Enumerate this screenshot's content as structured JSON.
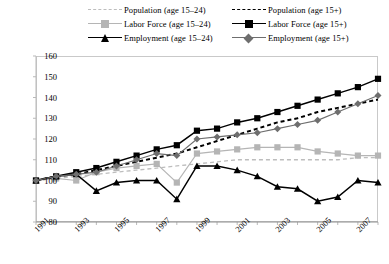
{
  "legend": {
    "items": [
      {
        "label": "Population (age 15–24)",
        "marker": "none",
        "line": "dashed",
        "color": "#bdbdbd",
        "col": 0,
        "row": 0
      },
      {
        "label": "Population (age 15+)",
        "marker": "none",
        "line": "dashed",
        "color": "#000000",
        "col": 1,
        "row": 0
      },
      {
        "label": "Labor Force (age 15–24)",
        "marker": "square",
        "line": "solid",
        "color": "#b5b5b5",
        "col": 0,
        "row": 1
      },
      {
        "label": "Labor Force (age 15+)",
        "marker": "square",
        "line": "solid",
        "color": "#000000",
        "col": 1,
        "row": 1
      },
      {
        "label": "Employment (age 15–24)",
        "marker": "triangle",
        "line": "solid",
        "color": "#000000",
        "col": 0,
        "row": 2
      },
      {
        "label": "Employment (age 15+)",
        "marker": "diamond",
        "line": "solid",
        "color": "#6e6e6e",
        "col": 1,
        "row": 2
      }
    ]
  },
  "chart_data": {
    "type": "line",
    "title": "",
    "xlabel": "",
    "ylabel": "",
    "xlim": [
      1991,
      2008
    ],
    "ylim": [
      80,
      160
    ],
    "yticks": [
      80,
      90,
      100,
      110,
      120,
      130,
      140,
      150,
      160
    ],
    "xticks": [
      1991,
      1993,
      1995,
      1997,
      1999,
      2001,
      2003,
      2005,
      2007
    ],
    "x": [
      1991,
      1992,
      1993,
      1994,
      1995,
      1996,
      1997,
      1998,
      1999,
      2000,
      2001,
      2002,
      2003,
      2004,
      2005,
      2006,
      2007,
      2008
    ],
    "grid": false,
    "legend_position": "top",
    "series": [
      {
        "name": "Population (age 15–24)",
        "marker": "none",
        "line": "dashed",
        "color": "#bdbdbd",
        "values": [
          100,
          101,
          102,
          103,
          104,
          105,
          106,
          107,
          108,
          109,
          110,
          110,
          110,
          110,
          110,
          110,
          111,
          111
        ]
      },
      {
        "name": "Population (age 15+)",
        "marker": "none",
        "line": "dashed",
        "color": "#000000",
        "values": [
          100,
          102,
          103,
          105,
          107,
          109,
          111,
          113,
          116,
          119,
          122,
          125,
          128,
          130,
          133,
          135,
          137,
          139
        ]
      },
      {
        "name": "Labor Force (age 15–24)",
        "marker": "square",
        "line": "solid",
        "color": "#b5b5b5",
        "values": [
          100,
          101,
          100,
          104,
          106,
          107,
          108,
          99,
          113,
          114,
          115,
          116,
          116,
          116,
          114,
          113,
          112,
          112
        ]
      },
      {
        "name": "Labor Force (age 15+)",
        "marker": "square",
        "line": "solid",
        "color": "#000000",
        "values": [
          100,
          102,
          104,
          106,
          109,
          112,
          115,
          117,
          124,
          125,
          128,
          130,
          133,
          136,
          139,
          142,
          145,
          149
        ]
      },
      {
        "name": "Employment (age 15–24)",
        "marker": "triangle",
        "line": "solid",
        "color": "#000000",
        "values": [
          100,
          102,
          103,
          95,
          99,
          100,
          100,
          91,
          107,
          107,
          105,
          102,
          97,
          96,
          90,
          92,
          100,
          99
        ]
      },
      {
        "name": "Employment (age 15+)",
        "marker": "diamond",
        "line": "solid",
        "color": "#6e6e6e",
        "values": [
          100,
          102,
          103,
          104,
          107,
          110,
          113,
          112,
          120,
          121,
          122,
          123,
          125,
          127,
          129,
          133,
          137,
          141
        ]
      }
    ]
  }
}
